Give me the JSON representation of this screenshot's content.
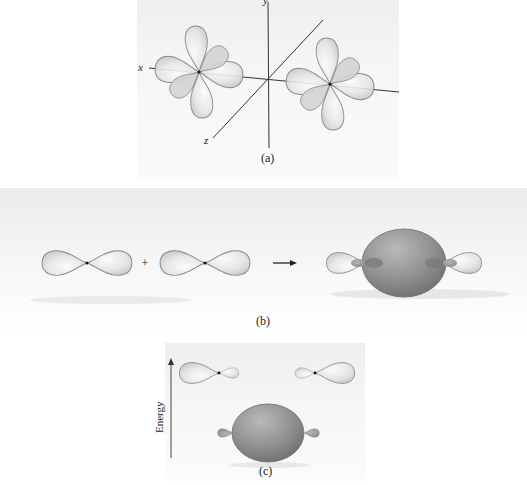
{
  "panel_a": {
    "caption": "(a)",
    "axes": {
      "x": "x",
      "y": "y",
      "z": "z"
    },
    "description": "Two atoms each with three p orbitals (px, py, pz) along a shared x axis"
  },
  "panel_b": {
    "caption": "(b)",
    "operator": "+",
    "description": "Two p orbitals combine to form a sigma bonding molecular orbital"
  },
  "panel_c": {
    "caption": "(c)",
    "axis_label": "Energy",
    "description": "Energy diagram: atomic p orbitals higher, bonding sigma orbital lower"
  },
  "colors": {
    "lobe_light": "#e4e4e4",
    "lobe_edge": "#8a8a8a",
    "bonding_orbital": "#8c8c8c",
    "axis_line": "#333333"
  }
}
